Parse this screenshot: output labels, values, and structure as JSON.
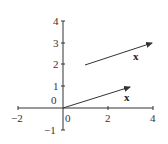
{
  "diagram": {
    "type": "vector-plot",
    "x_axis": {
      "min": -2,
      "max": 4,
      "ticks": [
        -2,
        0,
        2,
        4
      ],
      "tick_labels": [
        "−2",
        "0",
        "2",
        "4"
      ]
    },
    "y_axis": {
      "min": -1,
      "max": 4,
      "ticks": [
        -1,
        0,
        1,
        2,
        3,
        4
      ],
      "tick_labels": [
        "−1",
        "0",
        "1",
        "2",
        "3",
        "4"
      ]
    },
    "vectors": [
      {
        "name": "vector-x-origin",
        "from": [
          0,
          0
        ],
        "to": [
          3,
          1
        ],
        "label": "x"
      },
      {
        "name": "vector-x-translated",
        "from": [
          1,
          2
        ],
        "to": [
          4,
          3
        ],
        "label": "x"
      }
    ],
    "colors": {
      "axis": "#333333",
      "vector": "#333333",
      "background": "#ffffff"
    }
  }
}
